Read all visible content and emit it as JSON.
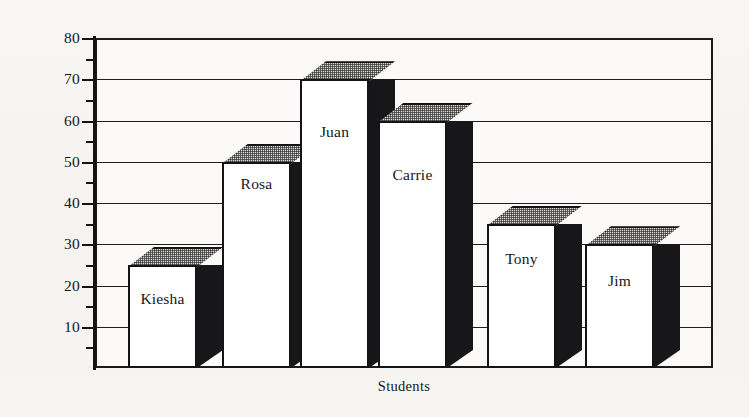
{
  "chart_data": {
    "type": "bar",
    "title": "",
    "xlabel": "Students",
    "ylabel": "Number of Earthworms Per Square Foot",
    "categories": [
      "Kiesha",
      "Rosa",
      "Juan",
      "Carrie",
      "Tony",
      "Jim"
    ],
    "values": [
      25,
      50,
      70,
      60,
      35,
      30
    ],
    "ylim": [
      0,
      80
    ],
    "ytick_major": [
      10,
      20,
      30,
      40,
      50,
      60,
      70,
      80
    ],
    "ytick_minor": [
      5,
      15,
      25,
      35,
      45,
      55,
      65,
      75
    ],
    "ytick_labels": [
      "10",
      "20",
      "30",
      "40",
      "50",
      "60",
      "70",
      "80"
    ],
    "grid": "horizontal-major",
    "legend": "none",
    "bar_style": "3d-extruded",
    "bar_labels_inside": true,
    "colors": {
      "bar_front": "#ffffff",
      "bar_side": "#17171a",
      "bar_top": "#d8d6d2",
      "outline": "#141416",
      "grid": "#1e1e20",
      "text": "#17171a",
      "background": "#f6f5f2",
      "plot_background": "#fbfaf8"
    }
  },
  "axes": {
    "y_title": "Number of Earthworms Per Square Foot",
    "x_title": "Students"
  },
  "bars": [
    {
      "name": "Kiesha",
      "value": 25,
      "label": "Kiesha"
    },
    {
      "name": "Rosa",
      "value": 50,
      "label": "Rosa"
    },
    {
      "name": "Juan",
      "value": 70,
      "label": "Juan"
    },
    {
      "name": "Carrie",
      "value": 60,
      "label": "Carrie"
    },
    {
      "name": "Tony",
      "value": 35,
      "label": "Tony"
    },
    {
      "name": "Jim",
      "value": 30,
      "label": "Jim"
    }
  ]
}
